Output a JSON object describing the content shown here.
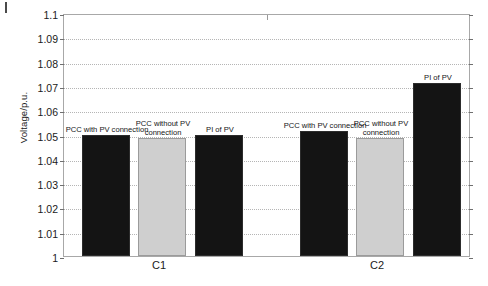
{
  "chart_data": {
    "type": "bar",
    "title": "",
    "subtitle": "",
    "xlabel": "",
    "ylabel": "Voltage/p.u.",
    "ylim": [
      1,
      1.1
    ],
    "ytick_step": 0.01,
    "ytick_labels": [
      "1.1",
      "1.09",
      "1.08",
      "1.07",
      "1.06",
      "1.05",
      "1.04",
      "1.03",
      "1.02",
      "1.01",
      "1"
    ],
    "ytick_values": [
      1.1,
      1.09,
      1.08,
      1.07,
      1.06,
      1.05,
      1.04,
      1.03,
      1.02,
      1.01,
      1
    ],
    "grid": true,
    "grid_style": "dotted-horizontal",
    "legend": "none",
    "legend_position": "inline-bar-annotations",
    "categories": [
      "C1",
      "C2"
    ],
    "series": [
      {
        "name": "PCC with PV connection",
        "color": "#141414",
        "values": [
          1.05,
          1.0515
        ]
      },
      {
        "name": "PCC without PV connection",
        "color": "#cfcfcf",
        "values": [
          1.0487,
          1.0487
        ]
      },
      {
        "name": "PI of PV",
        "color": "#141414",
        "values": [
          1.05,
          1.0712
        ]
      }
    ],
    "bars": [
      {
        "group": "C1",
        "label": "PCC with PV connection",
        "value": 1.05,
        "color": "#141414"
      },
      {
        "group": "C1",
        "label": "PCC without PV connection",
        "value": 1.0487,
        "color": "#cfcfcf"
      },
      {
        "group": "C1",
        "label": "PI of PV",
        "value": 1.05,
        "color": "#141414"
      },
      {
        "group": "C2",
        "label": "PCC with PV connection",
        "value": 1.0515,
        "color": "#141414"
      },
      {
        "group": "C2",
        "label": "PCC without PV connection",
        "value": 1.0487,
        "color": "#cfcfcf"
      },
      {
        "group": "C2",
        "label": "PI of PV",
        "value": 1.0712,
        "color": "#141414"
      }
    ]
  },
  "axes": {
    "y_title": "Voltage/p.u.",
    "ticks": [
      {
        "label": "1.1"
      },
      {
        "label": "1.09"
      },
      {
        "label": "1.08"
      },
      {
        "label": "1.07"
      },
      {
        "label": "1.06"
      },
      {
        "label": "1.05"
      },
      {
        "label": "1.04"
      },
      {
        "label": "1.03"
      },
      {
        "label": "1.02"
      },
      {
        "label": "1.01"
      },
      {
        "label": "1"
      }
    ]
  },
  "groups": [
    {
      "label": "C1"
    },
    {
      "label": "C2"
    }
  ],
  "bar_labels": [
    {
      "text": "PCC with PV connection"
    },
    {
      "text": "PCC without PV connection"
    },
    {
      "text": "PI of PV"
    },
    {
      "text": "PCC with PV connection"
    },
    {
      "text": "PCC without PV connection"
    },
    {
      "text": "PI of PV"
    }
  ],
  "colors": {
    "bar_dark": "#141414",
    "bar_light": "#cfcfcf",
    "grid": "#b5b5b5",
    "frame": "#a8a8a8",
    "text": "#1a1a1a",
    "background": "#ffffff"
  }
}
